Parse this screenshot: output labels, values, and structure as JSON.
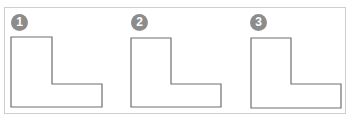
{
  "figure": {
    "frame_border_color": "#cfcfcf",
    "shape_stroke_color": "#6e6e6e",
    "badge_color": "#8c8c8c",
    "panels": [
      {
        "label": "1",
        "shape": "L-shape"
      },
      {
        "label": "2",
        "shape": "L-shape"
      },
      {
        "label": "3",
        "shape": "L-shape"
      }
    ]
  }
}
